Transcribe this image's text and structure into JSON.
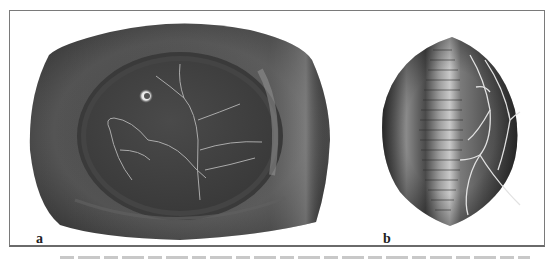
{
  "figure": {
    "panels": [
      {
        "label": "a",
        "subject": "flattened-globe-fundus-illustration"
      },
      {
        "label": "b",
        "subject": "lemon-shaped-globe-with-ribs-and-vessels"
      }
    ],
    "colors": {
      "frame": "#7a7a7a",
      "globe_dark": "#3e3e3e",
      "globe_mid": "#5a5a5a",
      "highlight": "#bdbdbd",
      "vessel": "#d8d8d8"
    },
    "caption": {
      "visible": "cut-off (illegible)"
    }
  }
}
